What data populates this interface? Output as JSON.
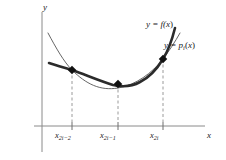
{
  "figure": {
    "kind": "calculus-diagram",
    "background_color": "#ffffff",
    "axes": {
      "y_label": "y",
      "x_label": "x",
      "axis_color": "#8a8a8a",
      "origin_px": [
        42,
        126
      ],
      "x_axis_end_px": [
        205,
        126
      ],
      "y_axis_top_px": [
        42,
        12
      ]
    },
    "curves": [
      {
        "name": "f-curve",
        "label": "y = f(x)",
        "label_base": "y = f(",
        "label_var": "x",
        "label_close": ")",
        "color": "#2b2b2b",
        "stroke_width": 2.6,
        "style": "thick-solid"
      },
      {
        "name": "p-curve",
        "label": "y = p i (x)",
        "label_base": "y = p",
        "label_sub": "i",
        "label_var": "x",
        "color": "#4a4a4a",
        "stroke_width": 0.9,
        "style": "thin-solid"
      }
    ],
    "nodes": [
      {
        "name": "node-left",
        "label": "x 2i-2",
        "px": [
          72,
          70
        ],
        "color": "#111111"
      },
      {
        "name": "node-middle",
        "label": "x 2i-1",
        "px": [
          118,
          84
        ],
        "color": "#111111"
      },
      {
        "name": "node-right",
        "label": "x 2i",
        "px": [
          163,
          59
        ],
        "color": "#111111"
      }
    ],
    "ticks": [
      {
        "name": "tick-x2i-2",
        "base": "x",
        "sub": "2i−2",
        "x_px": 72
      },
      {
        "name": "tick-x2i-1",
        "base": "x",
        "sub": "2i−1",
        "x_px": 118
      },
      {
        "name": "tick-x2i",
        "base": "x",
        "sub": "2i",
        "x_px": 163
      }
    ],
    "dashed_lines": {
      "color": "#9a9a9a",
      "dash_pattern": "3 2.5"
    }
  }
}
